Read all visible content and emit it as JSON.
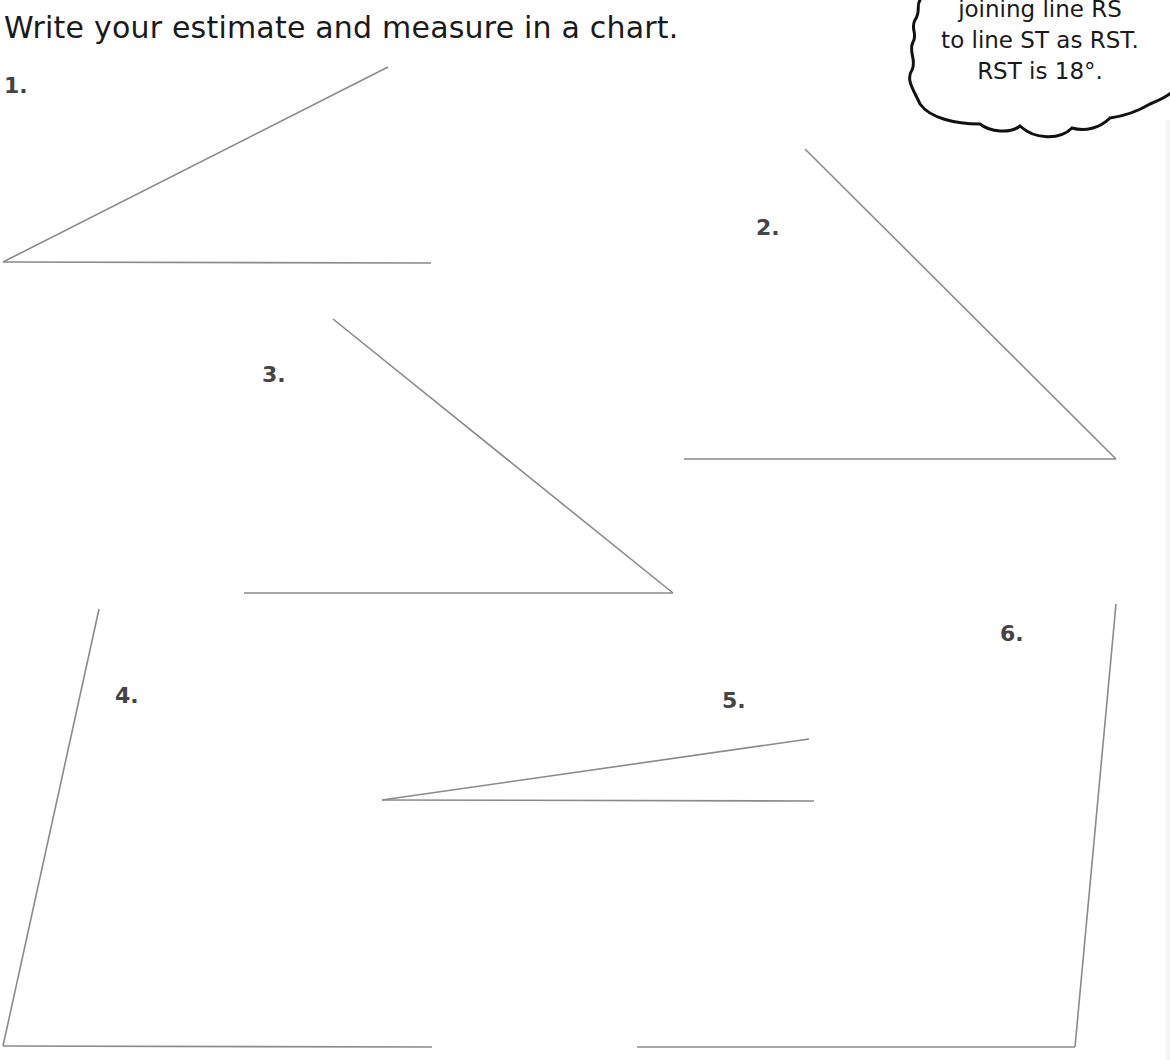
{
  "worksheet": {
    "instruction": "Write your estimate and measure in a chart.",
    "callout": {
      "lines": [
        "joining line RS",
        "to line ST as RST.",
        "RST is 18°."
      ]
    },
    "colors": {
      "text": "#1a1a1a",
      "label": "#444444",
      "line": "#8a8a8a",
      "bubble_outline": "#111111"
    },
    "angles": [
      {
        "label": "1.",
        "vertex": [
          3,
          262
        ],
        "ray_end": [
          388,
          67
        ],
        "base_end": [
          431,
          263
        ]
      },
      {
        "label": "2.",
        "vertex": [
          1116,
          459
        ],
        "ray_end": [
          805,
          149
        ],
        "base_end": [
          684,
          459
        ]
      },
      {
        "label": "3.",
        "vertex": [
          673,
          593
        ],
        "ray_end": [
          333,
          319
        ],
        "base_end": [
          244,
          593
        ]
      },
      {
        "label": "4.",
        "vertex": [
          3,
          1046
        ],
        "ray_end": [
          99,
          609
        ],
        "base_end": [
          432,
          1047
        ]
      },
      {
        "label": "5.",
        "vertex": [
          382,
          800
        ],
        "ray_end": [
          809,
          739
        ],
        "base_end": [
          814,
          801
        ]
      },
      {
        "label": "6.",
        "vertex": [
          1075,
          1047
        ],
        "ray_end": [
          1116,
          604
        ],
        "base_end": [
          637,
          1047
        ]
      }
    ]
  }
}
